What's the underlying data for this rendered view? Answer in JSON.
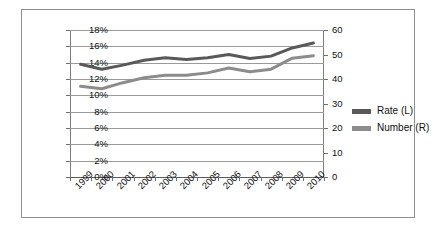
{
  "chart_data": {
    "type": "line",
    "title": "",
    "subtitle": "",
    "xlabel": "",
    "ylabel": "",
    "grid": true,
    "legend_position": "right",
    "categories": [
      "1999",
      "2000",
      "2001",
      "2002",
      "2003",
      "2004",
      "2005",
      "2006",
      "2007",
      "2008",
      "2009",
      "2010"
    ],
    "axes": {
      "left": {
        "label": "",
        "min": 0,
        "max": 18,
        "step": 2,
        "suffix": "%",
        "ticks": [
          "0%",
          "2%",
          "4%",
          "6%",
          "8%",
          "10%",
          "12%",
          "14%",
          "16%",
          "18%"
        ]
      },
      "right": {
        "label": "",
        "min": 0,
        "max": 60,
        "step": 10,
        "ticks": [
          "0",
          "10",
          "20",
          "30",
          "40",
          "50",
          "60"
        ]
      }
    },
    "series": [
      {
        "name": "Rate (L)",
        "axis": "left",
        "color": "#595959",
        "values": [
          13.8,
          13.2,
          13.7,
          14.3,
          14.6,
          14.4,
          14.6,
          15.0,
          14.5,
          14.8,
          15.8,
          16.4
        ]
      },
      {
        "name": "Number (R)",
        "axis": "right",
        "color": "#8c8c8c",
        "values": [
          37.0,
          36.0,
          38.5,
          40.5,
          41.5,
          41.5,
          42.5,
          44.5,
          43.0,
          44.0,
          48.5,
          49.5
        ]
      }
    ]
  },
  "legend": {
    "items": [
      {
        "label": "Rate (L)",
        "color": "#595959"
      },
      {
        "label": "Number (R)",
        "color": "#8c8c8c"
      }
    ]
  }
}
